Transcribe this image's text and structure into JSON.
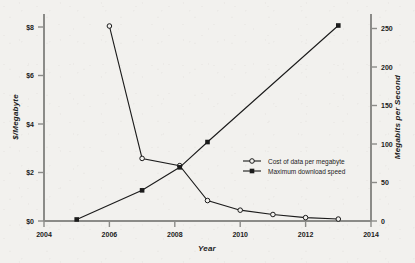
{
  "chart_data": {
    "type": "line",
    "title": "",
    "xlabel": "Year",
    "ylabel": "$/Megabyte",
    "y2label": "Megabits per Second",
    "xlim": [
      2004,
      2014
    ],
    "ylim": [
      0,
      8.6
    ],
    "y2lim": [
      0,
      270
    ],
    "grid": false,
    "legend_position": "center-right",
    "xticks": [
      "2004",
      "2006",
      "2008",
      "2010",
      "2012",
      "2014"
    ],
    "xtick_values": [
      2004,
      2006,
      2008,
      2010,
      2012,
      2014
    ],
    "yticks": [
      "$0",
      "$2",
      "$4",
      "$6",
      "$8"
    ],
    "ytick_values": [
      0,
      2,
      4,
      6,
      8
    ],
    "y2ticks": [
      "0",
      "50",
      "100",
      "150",
      "200",
      "250"
    ],
    "y2tick_values": [
      0,
      50,
      100,
      150,
      200,
      250
    ],
    "series": [
      {
        "name": "Cost of data per megabyte",
        "axis": "left",
        "marker": "open-circle",
        "color": "#1b1b1b",
        "x": [
          2006,
          2007,
          2008.15,
          2009,
          2010,
          2011,
          2012,
          2013
        ],
        "values": [
          8.1,
          2.6,
          2.3,
          0.85,
          0.45,
          0.27,
          0.14,
          0.08
        ]
      },
      {
        "name": "Maximum download speed",
        "axis": "right",
        "marker": "filled-square",
        "color": "#1b1b1b",
        "x": [
          2005,
          2007,
          2008.15,
          2009,
          2013
        ],
        "values": [
          2,
          40,
          70,
          103,
          255
        ]
      }
    ]
  },
  "legend": {
    "items": [
      {
        "label": "Cost of data per megabyte",
        "marker": "open-circle"
      },
      {
        "label": "Maximum download speed",
        "marker": "filled-square"
      }
    ]
  },
  "colors": {
    "background": "#f2f1ee",
    "ink": "#1b1b1b",
    "axis": "#8b8b88"
  }
}
